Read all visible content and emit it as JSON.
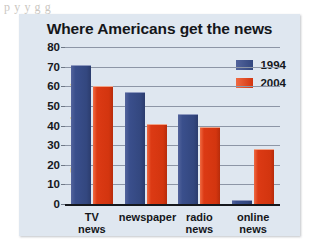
{
  "page": {
    "scan_text_fragment": "p          y    y g     g"
  },
  "chart_data": {
    "type": "bar",
    "title": "Where Americans get the news",
    "xlabel": "",
    "ylabel": "Percent of people",
    "categories": [
      "TV\nnews",
      "newspaper",
      "radio\nnews",
      "online\nnews"
    ],
    "ylim": [
      0,
      80
    ],
    "yticks": [
      80,
      70,
      60,
      50,
      40,
      30,
      20,
      10,
      0
    ],
    "grid": true,
    "legend_position": "top-right",
    "series": [
      {
        "name": "1994",
        "color": "#3A4F8C",
        "values": [
          71,
          57,
          46,
          2
        ]
      },
      {
        "name": "2004",
        "color": "#DC3A14",
        "values": [
          60,
          41,
          39,
          28
        ]
      }
    ]
  }
}
